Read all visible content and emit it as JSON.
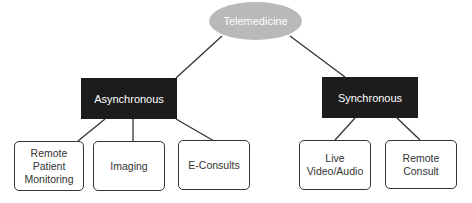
{
  "diagram": {
    "root": {
      "label": "Telemedicine",
      "color": "#b9b9b9"
    },
    "categories": [
      {
        "label": "Asynchronous",
        "children": [
          "Remote Patient Monitoring",
          "Imaging",
          "E-Consults"
        ]
      },
      {
        "label": "Synchronous",
        "children": [
          "Live Video/Audio",
          "Remote Consult"
        ]
      }
    ],
    "leaves": {
      "rpm": "Remote Patient Monitoring",
      "imaging": "Imaging",
      "econsults": "E-Consults",
      "live": "Live Video/Audio",
      "remote_consult": "Remote Consult"
    },
    "colors": {
      "category_fill": "#1c1c1c",
      "leaf_border": "#333333"
    }
  }
}
